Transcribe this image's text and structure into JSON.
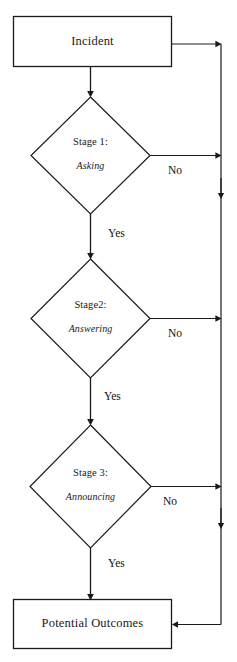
{
  "diagram": {
    "type": "flowchart",
    "stroke_color": "#1a1a1a",
    "background_color": "#ffffff",
    "nodes": [
      {
        "id": "incident",
        "shape": "rectangle",
        "label": "Incident"
      },
      {
        "id": "stage1",
        "shape": "diamond",
        "title": "Stage 1:",
        "subtitle": "Asking"
      },
      {
        "id": "stage2",
        "shape": "diamond",
        "title": "Stage2:",
        "subtitle": "Answering"
      },
      {
        "id": "stage3",
        "shape": "diamond",
        "title": "Stage 3:",
        "subtitle": "Announcing"
      },
      {
        "id": "outcomes",
        "shape": "rectangle",
        "label": "Potential Outcomes"
      }
    ],
    "edge_labels": {
      "no_stage1": "No",
      "no_stage2": "No",
      "no_stage3": "No",
      "yes_stage1": "Yes",
      "yes_stage2": "Yes",
      "yes_stage3": "Yes"
    }
  }
}
